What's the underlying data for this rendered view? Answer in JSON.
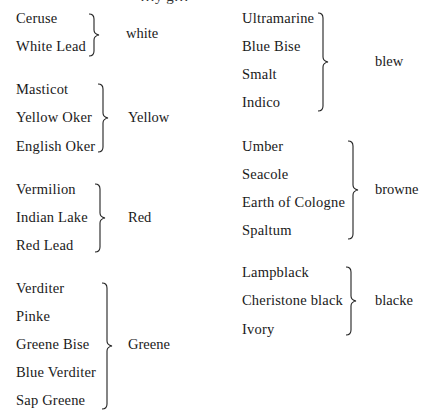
{
  "page": {
    "top_cut_text": "…y   g…"
  },
  "groups": [
    {
      "id": "white",
      "label": "white",
      "items": [
        "Ceruse",
        "White Lead"
      ]
    },
    {
      "id": "yellow",
      "label": "Yellow",
      "items": [
        "Masticot",
        "Yellow Oker",
        "English Oker"
      ]
    },
    {
      "id": "red",
      "label": "Red",
      "items": [
        "Vermilion",
        "Indian Lake",
        "Red Lead"
      ]
    },
    {
      "id": "greene",
      "label": "Greene",
      "items": [
        "Verditer",
        "Pinke",
        "Greene Bise",
        "Blue Verditer",
        "Sap Greene"
      ]
    },
    {
      "id": "blew",
      "label": "blew",
      "items": [
        "Ultramarine",
        "Blue Bise",
        "Smalt",
        "Indico"
      ]
    },
    {
      "id": "browne",
      "label": "browne",
      "items": [
        "Umber",
        "Seacole",
        "Earth of Cologne",
        "Spaltum"
      ]
    },
    {
      "id": "blacke",
      "label": "blacke",
      "items": [
        "Lampblack",
        "Cheristone black",
        "Ivory"
      ]
    }
  ]
}
